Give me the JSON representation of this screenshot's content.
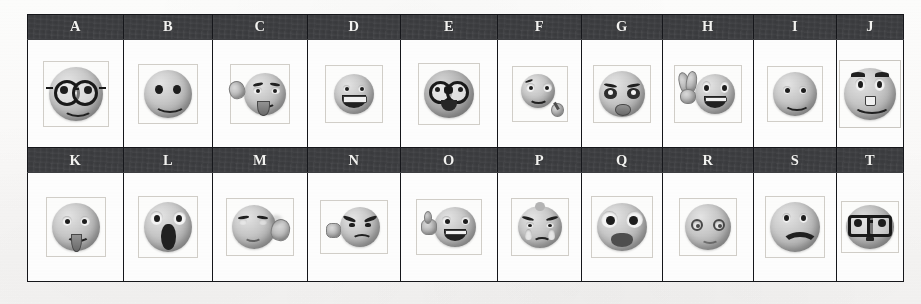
{
  "document": {
    "type": "scanned-worksheet",
    "background_color": "#fbfbfa",
    "header_band_color": "#3e3f42",
    "header_text_color": "#f2f2f0",
    "grid_line_color": "#15161a",
    "image_frame_color": "#d2cfc9"
  },
  "table": {
    "columns": 10,
    "rows": 2,
    "rows_data": [
      {
        "row_index": 1,
        "cells": [
          {
            "label": "A",
            "icon": "smiley-round-glasses-icon",
            "description": "Smiling face wearing large round black eyeglasses"
          },
          {
            "label": "B",
            "icon": "smiley-classic-smile-icon",
            "description": "Classic smiley face with two round eyes and a wide smile"
          },
          {
            "label": "C",
            "icon": "smiley-waving-tongue-icon",
            "description": "Smiley waving one hand with tongue sticking out"
          },
          {
            "label": "D",
            "icon": "smiley-big-grin-teeth-icon",
            "description": "Smiley with a big toothy grin"
          },
          {
            "label": "E",
            "icon": "smiley-wearing-mask-icon",
            "description": "Dark smiley face with goggles or mask over the eyes"
          },
          {
            "label": "F",
            "icon": "smiley-with-microphone-icon",
            "description": "Small smiley holding a microphone"
          },
          {
            "label": "G",
            "icon": "smiley-sad-pouting-icon",
            "description": "Sad pouting face with droopy eyes and a frown"
          },
          {
            "label": "H",
            "icon": "smiley-peace-sign-icon",
            "description": "Grinning smiley making a peace or victory hand sign"
          },
          {
            "label": "I",
            "icon": "smiley-happy-simple-icon",
            "description": "Simple happy smiley face"
          },
          {
            "label": "J",
            "icon": "smiley-raised-brows-grin-icon",
            "description": "Grinning smiley with raised eyebrows and visible teeth"
          }
        ]
      },
      {
        "row_index": 2,
        "cells": [
          {
            "label": "K",
            "icon": "smiley-tongue-out-icon",
            "description": "Smiley sticking its tongue out"
          },
          {
            "label": "L",
            "icon": "smiley-screaming-icon",
            "description": "Screaming face with wide eyes and a large open mouth"
          },
          {
            "label": "M",
            "icon": "smiley-listening-hand-ear-icon",
            "description": "Smiley cupping a hand to its ear to listen"
          },
          {
            "label": "N",
            "icon": "smiley-angry-fist-icon",
            "description": "Angry face with furrowed brows raising a fist"
          },
          {
            "label": "O",
            "icon": "smiley-thumbs-up-laughing-icon",
            "description": "Laughing smiley giving a thumbs up"
          },
          {
            "label": "P",
            "icon": "smiley-crying-icon",
            "description": "Crying face with tears"
          },
          {
            "label": "Q",
            "icon": "smiley-shocked-big-eyes-icon",
            "description": "Shocked face with very large eyes and an open mouth"
          },
          {
            "label": "R",
            "icon": "smiley-dizzy-spiral-eyes-icon",
            "description": "Dizzy face with spiral eyes"
          },
          {
            "label": "S",
            "icon": "smiley-worried-frown-icon",
            "description": "Worried face with a heavy downturned frown"
          },
          {
            "label": "T",
            "icon": "smiley-rectangular-glasses-icon",
            "description": "Face wearing large rectangular eyeglasses"
          }
        ]
      }
    ]
  }
}
